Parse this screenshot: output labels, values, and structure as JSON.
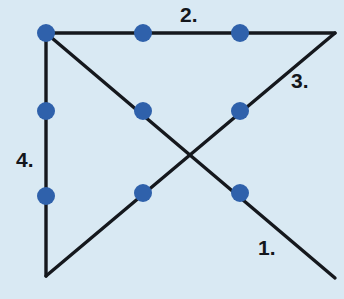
{
  "figure": {
    "background_color": "#d9e9f3",
    "line_color": "#15181d",
    "node_color": "#2f61ab",
    "label_color": "#14171c",
    "width": 344,
    "height": 299,
    "node_radius": 9,
    "line_width": 3.4
  },
  "labels": [
    {
      "id": "1",
      "text": "1.",
      "x": 258,
      "y": 237
    },
    {
      "id": "2",
      "text": "2.",
      "x": 180,
      "y": 4
    },
    {
      "id": "3",
      "text": "3.",
      "x": 291,
      "y": 70
    },
    {
      "id": "4",
      "text": "4.",
      "x": 16,
      "y": 149
    }
  ],
  "segments": [
    {
      "label": "1.",
      "orientation": "diagonal-descending",
      "x1": 46,
      "y1": 33,
      "x2": 335,
      "y2": 278
    },
    {
      "label": "2.",
      "orientation": "horizontal",
      "x1": 46,
      "y1": 33,
      "x2": 335,
      "y2": 33
    },
    {
      "label": "3.",
      "orientation": "diagonal-ascending",
      "x1": 46,
      "y1": 276,
      "x2": 335,
      "y2": 33
    },
    {
      "label": "4.",
      "orientation": "vertical",
      "x1": 46,
      "y1": 33,
      "x2": 46,
      "y2": 276
    }
  ],
  "nodes": [
    {
      "name": "top-left-vertex",
      "x": 46,
      "y": 33
    },
    {
      "name": "top-middle",
      "x": 143,
      "y": 33
    },
    {
      "name": "top-right-inner",
      "x": 240,
      "y": 33
    },
    {
      "name": "left-upper",
      "x": 46,
      "y": 111
    },
    {
      "name": "left-lower",
      "x": 46,
      "y": 196
    },
    {
      "name": "center-upper-left",
      "x": 143,
      "y": 111
    },
    {
      "name": "center-upper-right",
      "x": 240,
      "y": 111
    },
    {
      "name": "center-lower-left",
      "x": 143,
      "y": 193
    },
    {
      "name": "center-lower-right",
      "x": 240,
      "y": 193
    }
  ],
  "intersection": {
    "name": "x-crossing",
    "x": 188,
    "y": 154
  }
}
